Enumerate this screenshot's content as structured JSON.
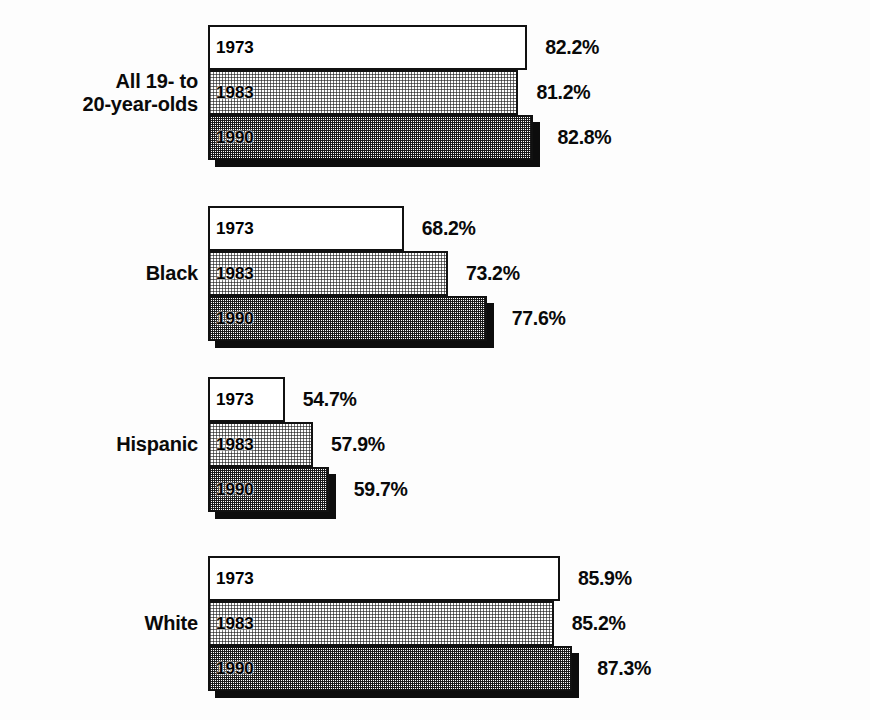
{
  "chart_data": {
    "type": "bar",
    "orientation": "horizontal",
    "title": "",
    "xlabel": "",
    "ylabel": "",
    "categories": [
      "All 19- to\n20-year-olds",
      "Black",
      "Hispanic",
      "White"
    ],
    "series": [
      {
        "name": "1973",
        "values": [
          82.2,
          68.2,
          54.7,
          85.9
        ]
      },
      {
        "name": "1983",
        "values": [
          81.2,
          73.2,
          57.9,
          85.2
        ]
      },
      {
        "name": "1990",
        "values": [
          82.8,
          77.6,
          59.7,
          87.3
        ]
      }
    ],
    "value_labels": [
      [
        "82.2%",
        "81.2%",
        "82.8%"
      ],
      [
        "68.2%",
        "73.2%",
        "77.6%"
      ],
      [
        "54.7%",
        "57.9%",
        "59.7%"
      ],
      [
        "85.9%",
        "85.2%",
        "87.3%"
      ]
    ],
    "xlim": [
      46,
      94
    ],
    "grid": false,
    "legend": "none",
    "series_fill_styles": [
      "white-outline",
      "light-dither",
      "dark-dither"
    ],
    "value_suffix": "%"
  },
  "groups": [
    {
      "label": "All 19- to\n20-year-olds",
      "bars": [
        {
          "year": "1973",
          "value": "82.2%",
          "num": 82.2
        },
        {
          "year": "1983",
          "value": "81.2%",
          "num": 81.2
        },
        {
          "year": "1990",
          "value": "82.8%",
          "num": 82.8
        }
      ]
    },
    {
      "label": "Black",
      "bars": [
        {
          "year": "1973",
          "value": "68.2%",
          "num": 68.2
        },
        {
          "year": "1983",
          "value": "73.2%",
          "num": 73.2
        },
        {
          "year": "1990",
          "value": "77.6%",
          "num": 77.6
        }
      ]
    },
    {
      "label": "Hispanic",
      "bars": [
        {
          "year": "1973",
          "value": "54.7%",
          "num": 54.7
        },
        {
          "year": "1983",
          "value": "57.9%",
          "num": 57.9
        },
        {
          "year": "1990",
          "value": "59.7%",
          "num": 59.7
        }
      ]
    },
    {
      "label": "White",
      "bars": [
        {
          "year": "1973",
          "value": "85.9%",
          "num": 85.9
        },
        {
          "year": "1983",
          "value": "85.2%",
          "num": 85.2
        },
        {
          "year": "1990",
          "value": "87.3%",
          "num": 87.3
        }
      ]
    }
  ],
  "colors": {
    "ink": "#0a0a0a",
    "bar_outline": "#111111",
    "shadow": "#0d0d0d",
    "page_background": "#fdfdfd",
    "fill_1973": "#ffffff",
    "fill_1983": "#d9d9d9",
    "fill_1990": "#a8a8a8"
  }
}
